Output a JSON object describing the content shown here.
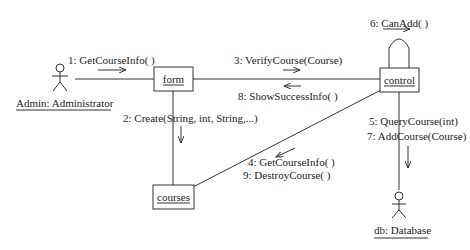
{
  "diagram": {
    "type": "uml-collaboration-diagram",
    "actors": {
      "admin": "Admin: Administrator",
      "db": "db: Database"
    },
    "objects": {
      "form": "form",
      "control": "control",
      "courses": "courses"
    },
    "messages": {
      "m1": "1: GetCourseInfo( )",
      "m2": "2: Create(String, int, String,...)",
      "m3": "3: VerifyCourse(Course)",
      "m4": "4: GetCourseInfo( )",
      "m5": "5: QueryCourse(int)",
      "m6": "6: CanAdd( )",
      "m7": "7: AddCourse(Course)",
      "m8": "8: ShowSuccessInfo( )",
      "m9": "9: DestroyCourse( )"
    }
  }
}
